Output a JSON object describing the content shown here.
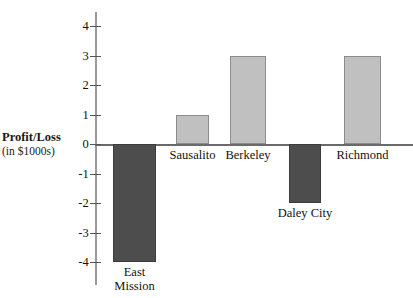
{
  "chart_data": {
    "type": "bar",
    "title": "",
    "subtitle": "",
    "xlabel": "",
    "ylabel": "Profit/Loss (in $1000s)",
    "ylabel_line1": "Profit/Loss",
    "ylabel_line2": "(in $1000s)",
    "categories": [
      "East Mission",
      "Sausalito",
      "Berkeley",
      "Daley City",
      "Richmond"
    ],
    "values": [
      -4,
      1,
      3,
      -2,
      3
    ],
    "ylim": [
      -4.5,
      4.5
    ],
    "yticks": [
      4,
      3,
      2,
      1,
      0,
      -1,
      -2,
      -3,
      -4
    ],
    "ytick_labels": [
      "4",
      "3",
      "2",
      "1",
      "0",
      "-1",
      "-2",
      "-3",
      "-4"
    ],
    "grid": false,
    "legend": "none",
    "colors": {
      "positive_bar": "#c0c0c0",
      "negative_bar": "#4d4d4d",
      "bar_border": "#8c8c8c",
      "axis": "#6a6a6a",
      "text": "#111111",
      "background": "#ffffff"
    },
    "bars": [
      {
        "label": "East Mission",
        "label_line1": "East",
        "label_line2": "Mission",
        "value": -4,
        "sign": "negative"
      },
      {
        "label": "Sausalito",
        "label_line1": "Sausalito",
        "label_line2": "",
        "value": 1,
        "sign": "positive"
      },
      {
        "label": "Berkeley",
        "label_line1": "Berkeley",
        "label_line2": "",
        "value": 3,
        "sign": "positive"
      },
      {
        "label": "Daley City",
        "label_line1": "Daley City",
        "label_line2": "",
        "value": -2,
        "sign": "negative"
      },
      {
        "label": "Richmond",
        "label_line1": "Richmond",
        "label_line2": "",
        "value": 3,
        "sign": "positive"
      }
    ]
  }
}
